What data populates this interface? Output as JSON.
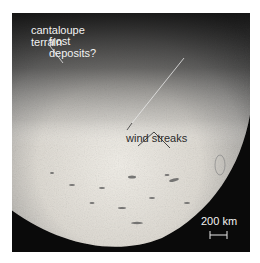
{
  "figure": {
    "annotations": {
      "cantaloupe": "cantaloupe\nterrain",
      "frost": "frost\ndeposits?",
      "wind": "wind streaks"
    },
    "scale_bar": {
      "label": "200 km"
    },
    "colors": {
      "background": "#0a0a0a",
      "surface_bright": "#e8e4dc",
      "surface_dark": "#6e6e6e",
      "label_light": "#f2f2f2",
      "label_dark": "#2a2a2a"
    }
  }
}
